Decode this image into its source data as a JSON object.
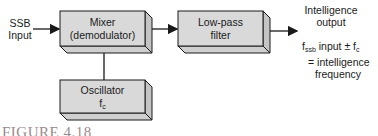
{
  "diagram": {
    "input_label": [
      "SSB",
      "Input"
    ],
    "blocks": [
      {
        "id": "mixer",
        "lines": [
          "Mixer",
          "(demodulator)"
        ]
      },
      {
        "id": "lowpass",
        "lines": [
          "Low-pass",
          "filter"
        ]
      },
      {
        "id": "oscillator",
        "lines": [
          "Oscillator",
          "f"
        ],
        "subscript": "c"
      }
    ],
    "output_label": [
      "Intelligence",
      "output"
    ],
    "equation": {
      "term1": "f",
      "term1_sub": "ssb",
      "term1_rest": " input ± f",
      "term2_sub": "c",
      "line2": "= intelligence",
      "line3": "frequency"
    },
    "caption": "FIGURE 4.18",
    "colors": {
      "box_face": "#d9d9d9",
      "box_side": "#c4c4c4",
      "stroke": "#1a1a1a",
      "caption": "#9a8a8e"
    }
  }
}
